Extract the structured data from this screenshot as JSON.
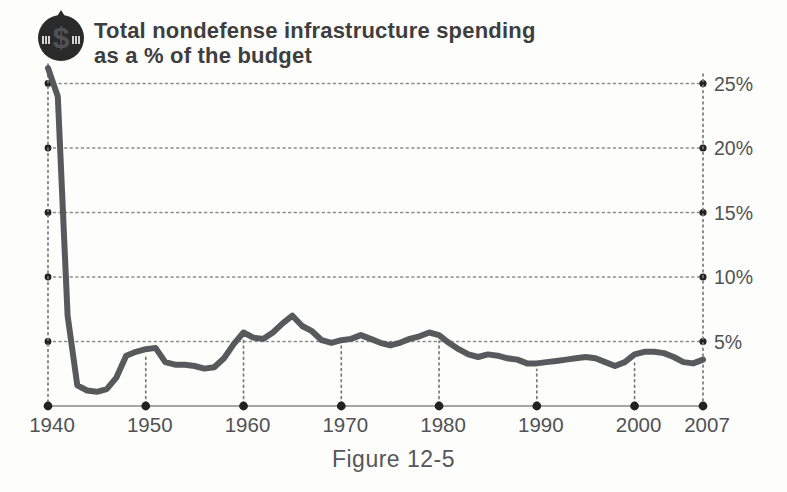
{
  "header": {
    "title_line1": "Total nondefense infrastructure spending",
    "title_line2": "as a % of the budget",
    "icon": "money-coin-icon",
    "icon_symbol": "$"
  },
  "caption": {
    "text": "Figure 12-5"
  },
  "colors": {
    "line": "#58595c",
    "tick_dot": "#222222",
    "grid": "#8c8c8c",
    "axis": "#888888",
    "label_text": "#515254",
    "title_text": "#3e3e40",
    "icon_fill": "#2a2a2a",
    "background": "#fdfdfb"
  },
  "chart_data": {
    "type": "line",
    "title": "Total nondefense infrastructure spending as a % of the budget",
    "xlabel": "",
    "ylabel": "",
    "x_range": [
      1940,
      2007
    ],
    "ylim": [
      0,
      27
    ],
    "grid": "dotted horizontal gridlines every 5%, dotted vertical guides at decade ticks",
    "legend": "none",
    "y_ticks": [
      {
        "v": 25,
        "label": "25%"
      },
      {
        "v": 20,
        "label": "20%"
      },
      {
        "v": 15,
        "label": "15%"
      },
      {
        "v": 10,
        "label": "10%"
      },
      {
        "v": 5,
        "label": "5%"
      }
    ],
    "x_ticks": [
      {
        "v": 1940,
        "label": "1940"
      },
      {
        "v": 1950,
        "label": "1950"
      },
      {
        "v": 1960,
        "label": "1960"
      },
      {
        "v": 1970,
        "label": "1970"
      },
      {
        "v": 1980,
        "label": "1980"
      },
      {
        "v": 1990,
        "label": "1990"
      },
      {
        "v": 2000,
        "label": "2000"
      },
      {
        "v": 2007,
        "label": "2007"
      }
    ],
    "years": [
      1940,
      1941,
      1942,
      1943,
      1944,
      1945,
      1946,
      1947,
      1948,
      1949,
      1950,
      1951,
      1952,
      1953,
      1954,
      1955,
      1956,
      1957,
      1958,
      1959,
      1960,
      1961,
      1962,
      1963,
      1964,
      1965,
      1966,
      1967,
      1968,
      1969,
      1970,
      1971,
      1972,
      1973,
      1974,
      1975,
      1976,
      1977,
      1978,
      1979,
      1980,
      1981,
      1982,
      1983,
      1984,
      1985,
      1986,
      1987,
      1988,
      1989,
      1990,
      1991,
      1992,
      1993,
      1994,
      1995,
      1996,
      1997,
      1998,
      1999,
      2000,
      2001,
      2002,
      2003,
      2004,
      2005,
      2006,
      2007
    ],
    "values": [
      26.2,
      24.0,
      7.0,
      1.6,
      1.2,
      1.1,
      1.3,
      2.2,
      3.9,
      4.2,
      4.4,
      4.5,
      3.4,
      3.2,
      3.2,
      3.1,
      2.9,
      3.0,
      3.7,
      4.8,
      5.7,
      5.3,
      5.2,
      5.7,
      6.4,
      7.0,
      6.2,
      5.8,
      5.1,
      4.9,
      5.1,
      5.2,
      5.5,
      5.2,
      4.9,
      4.7,
      4.9,
      5.2,
      5.4,
      5.7,
      5.5,
      4.9,
      4.4,
      4.0,
      3.8,
      4.0,
      3.9,
      3.7,
      3.6,
      3.3,
      3.3,
      3.4,
      3.5,
      3.6,
      3.7,
      3.8,
      3.7,
      3.4,
      3.1,
      3.4,
      4.0,
      4.2,
      4.2,
      4.1,
      3.8,
      3.4,
      3.3,
      3.6
    ]
  }
}
